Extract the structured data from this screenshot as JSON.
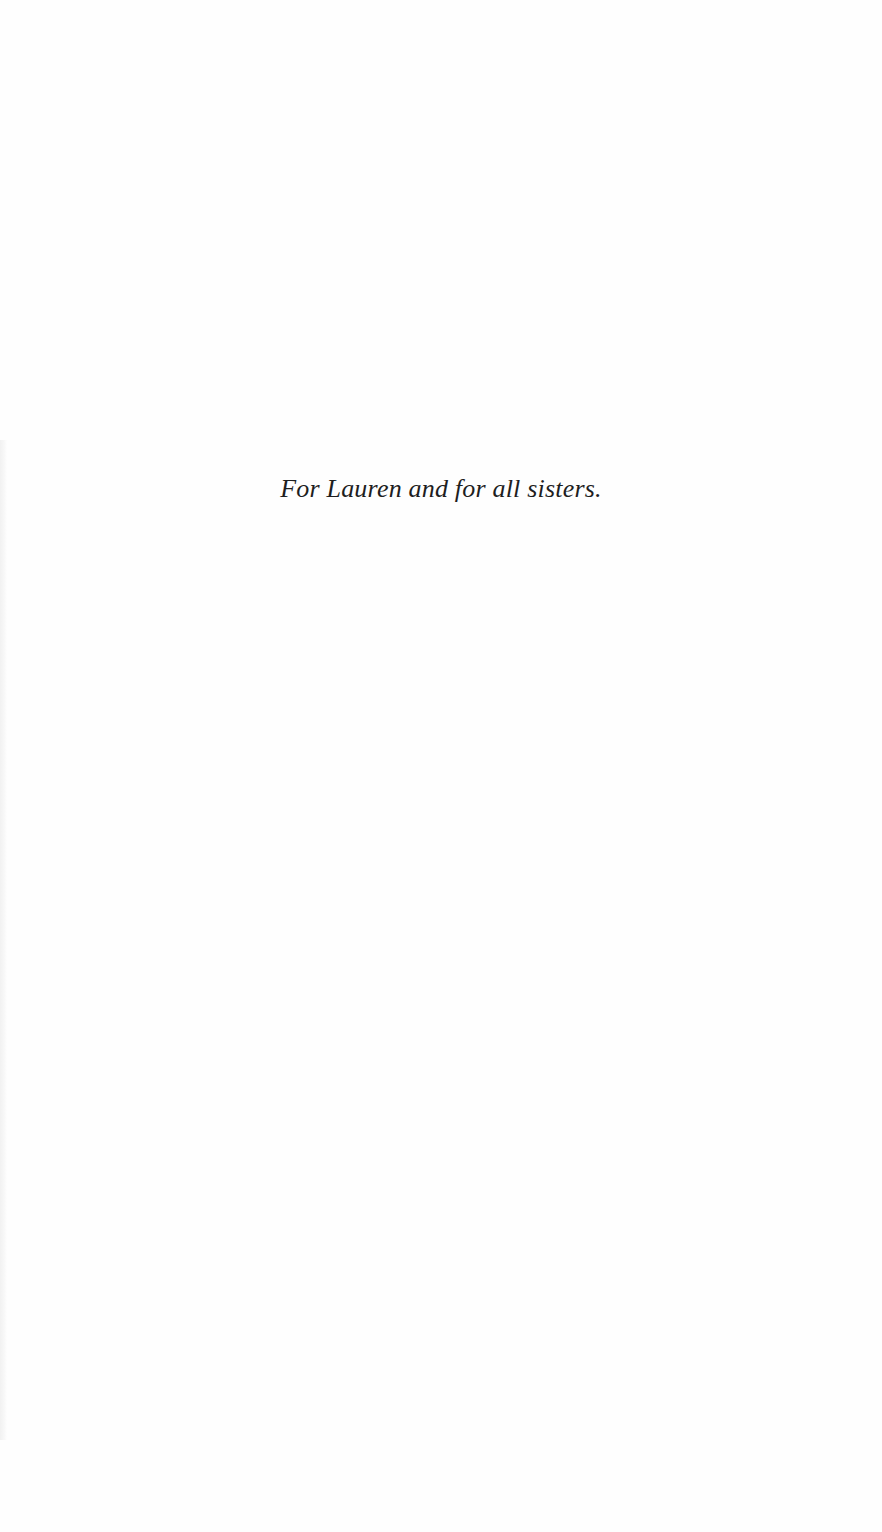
{
  "page": {
    "type": "dedication",
    "dedication_text": "For Lauren and for all sisters."
  }
}
